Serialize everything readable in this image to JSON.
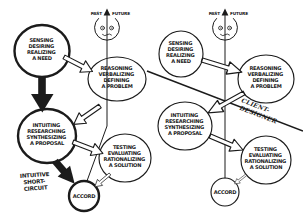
{
  "palette": {
    "ink": "#1b1b1b",
    "paper": "#ffffff"
  },
  "timeline": {
    "past": "PAST",
    "future": "FUTURE"
  },
  "stages": {
    "need": {
      "lines": [
        "SENSING",
        "DESIRING",
        "REALIZING",
        "A NEED"
      ]
    },
    "problem": {
      "lines": [
        "REASONING",
        "VERBALIZING",
        "DEFINING",
        "A PROBLEM"
      ]
    },
    "proposal": {
      "lines": [
        "INTUITING",
        "RESEARCHING",
        "SYNTHESIZING",
        "A PROPOSAL"
      ]
    },
    "solution": {
      "lines": [
        "TESTING",
        "EVALUATING",
        "RATIONALIZING",
        "A SOLUTION"
      ]
    },
    "accord": {
      "label": "ACCORD"
    }
  },
  "left_diagram": {
    "note": {
      "lines": [
        "INTUITIVE",
        "SHORT-",
        "CIRCUIT"
      ]
    }
  },
  "right_diagram": {
    "divide": {
      "lines": [
        "CLIENT-",
        "DESIGNER"
      ]
    }
  }
}
